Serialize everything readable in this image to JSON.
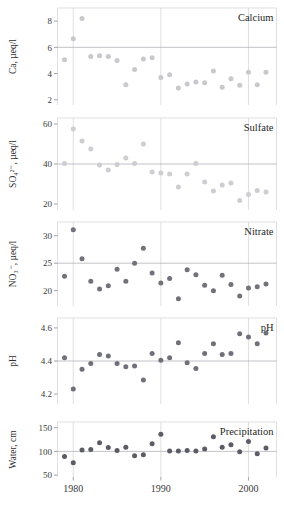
{
  "figure": {
    "kind": "small-multiples-scatter-timeseries",
    "width": 284,
    "height": 513,
    "background": "#ffffff",
    "x_axis": {
      "label": "",
      "ticks": [
        1980,
        1990,
        2000
      ],
      "tick_labels": [
        "1980",
        "1990",
        "2000"
      ],
      "range": [
        1978.2,
        2003.2
      ],
      "gridlines_at": [
        1980,
        1990,
        2000
      ]
    },
    "panel_order": [
      "calcium",
      "sulfate",
      "nitrate",
      "ph",
      "precipitation"
    ]
  },
  "chart_data": [
    {
      "type": "scatter",
      "id": "calcium",
      "title": "Calcium",
      "ylabel": "Ca, µeq/l",
      "xlabel": "",
      "ylim": [
        1.6,
        9.0
      ],
      "yticks": [
        2,
        4,
        6,
        8
      ],
      "ytick_labels": [
        "2",
        "4",
        "6",
        "8"
      ],
      "refline_y": 6,
      "grid": true,
      "legend": "none",
      "marker_color": "#c8c8cd",
      "x": [
        1979,
        1980,
        1981,
        1982,
        1983,
        1984,
        1985,
        1986,
        1987,
        1988,
        1989,
        1990,
        1991,
        1992,
        1993,
        1994,
        1995,
        1996,
        1997,
        1998,
        1999,
        2000,
        2001,
        2002
      ],
      "values": [
        5.05,
        6.65,
        8.2,
        5.3,
        5.35,
        5.3,
        5.0,
        3.15,
        4.3,
        5.1,
        5.2,
        3.7,
        3.9,
        2.9,
        3.2,
        3.35,
        3.3,
        4.2,
        2.95,
        3.6,
        3.1,
        4.1,
        3.15,
        4.1
      ]
    },
    {
      "type": "scatter",
      "id": "sulfate",
      "title": "Sulfate",
      "ylabel": "SO₄²⁻, µeq/l",
      "xlabel": "",
      "ylim": [
        17,
        63
      ],
      "yticks": [
        20,
        40,
        60
      ],
      "ytick_labels": [
        "20",
        "40",
        "60"
      ],
      "refline_y": 40,
      "grid": true,
      "legend": "none",
      "marker_color": "#cdcdd2",
      "x": [
        1979,
        1980,
        1981,
        1982,
        1983,
        1984,
        1985,
        1986,
        1987,
        1988,
        1989,
        1990,
        1991,
        1992,
        1993,
        1994,
        1995,
        1996,
        1997,
        1998,
        1999,
        2000,
        2001,
        2002
      ],
      "values": [
        40.3,
        57.5,
        51.5,
        47.5,
        39.5,
        37.0,
        39.7,
        43.0,
        40.3,
        50.0,
        36.0,
        35.5,
        35.0,
        28.5,
        35.0,
        40.2,
        31.0,
        26.5,
        29.5,
        30.5,
        21.8,
        24.8,
        26.8,
        26.0
      ]
    },
    {
      "type": "scatter",
      "id": "nitrate",
      "title": "Nitrate",
      "ylabel": "NO₃⁻, µeq/l",
      "xlabel": "",
      "ylim": [
        17.2,
        32.5
      ],
      "yticks": [
        20,
        25,
        30
      ],
      "ytick_labels": [
        "20",
        "25",
        "30"
      ],
      "refline_y": 25,
      "grid": true,
      "legend": "none",
      "marker_color": "#72727a",
      "x": [
        1979,
        1980,
        1981,
        1982,
        1983,
        1984,
        1985,
        1986,
        1987,
        1988,
        1989,
        1990,
        1991,
        1992,
        1993,
        1994,
        1995,
        1996,
        1997,
        1998,
        1999,
        2000,
        2001,
        2002
      ],
      "values": [
        22.6,
        31.1,
        25.8,
        21.7,
        20.3,
        20.9,
        23.9,
        21.7,
        25.0,
        27.7,
        23.2,
        21.4,
        22.2,
        18.5,
        23.8,
        22.9,
        21.0,
        20.0,
        22.8,
        21.1,
        19.0,
        20.5,
        20.7,
        21.2
      ]
    },
    {
      "type": "scatter",
      "id": "ph",
      "title": "pH",
      "ylabel": "pH",
      "xlabel": "",
      "ylim": [
        4.14,
        4.66
      ],
      "yticks": [
        4.2,
        4.4,
        4.6
      ],
      "ytick_labels": [
        "4.2",
        "4.4",
        "4.6"
      ],
      "refline_y": 4.4,
      "grid": true,
      "legend": "none",
      "marker_color": "#70707a",
      "x": [
        1979,
        1980,
        1981,
        1982,
        1983,
        1984,
        1985,
        1986,
        1987,
        1988,
        1989,
        1990,
        1991,
        1992,
        1993,
        1994,
        1995,
        1996,
        1997,
        1998,
        1999,
        2000,
        2001,
        2002
      ],
      "values": [
        4.42,
        4.23,
        4.35,
        4.385,
        4.44,
        4.43,
        4.385,
        4.365,
        4.37,
        4.285,
        4.445,
        4.405,
        4.42,
        4.51,
        4.39,
        4.355,
        4.445,
        4.505,
        4.44,
        4.445,
        4.565,
        4.545,
        4.505,
        4.57
      ]
    },
    {
      "type": "scatter",
      "id": "precipitation",
      "title": "Precipitation",
      "ylabel": "Water, cm",
      "xlabel": "",
      "ylim": [
        46,
        162
      ],
      "yticks": [
        50,
        100,
        150
      ],
      "ytick_labels": [
        "50",
        "100",
        "150"
      ],
      "refline_y": 100,
      "grid": true,
      "legend": "none",
      "marker_color": "#5c5c66",
      "x": [
        1979,
        1980,
        1981,
        1982,
        1983,
        1984,
        1985,
        1986,
        1987,
        1988,
        1989,
        1990,
        1991,
        1992,
        1993,
        1994,
        1995,
        1996,
        1997,
        1998,
        1999,
        2000,
        2001,
        2002
      ],
      "values": [
        89,
        76,
        103,
        104,
        118,
        108,
        102,
        109,
        91,
        93,
        116,
        136,
        101,
        101,
        102,
        101,
        105,
        131,
        109,
        114,
        99,
        121,
        95,
        107
      ]
    }
  ]
}
